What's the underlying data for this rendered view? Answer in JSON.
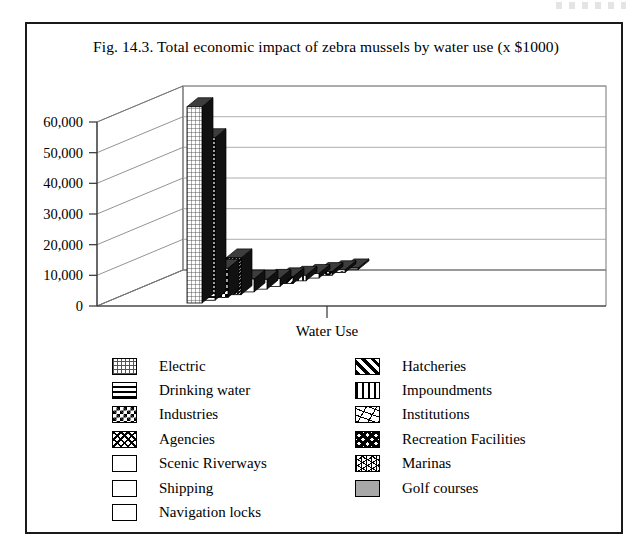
{
  "figure": {
    "caption": "Fig. 14.3.  Total economic impact of zebra mussels by water use (x $1000)"
  },
  "chart_data": {
    "type": "bar",
    "title": "Fig. 14.3.  Total economic impact of zebra mussels by water use (x $1000)",
    "xlabel": "Water Use",
    "ylabel": "",
    "ylim": [
      0,
      60000
    ],
    "yticks": [
      "0",
      "10,000",
      "20,000",
      "30,000",
      "40,000",
      "50,000",
      "60,000"
    ],
    "ytick_values": [
      0,
      10000,
      20000,
      30000,
      40000,
      50000,
      60000
    ],
    "grid": true,
    "projection": "3d-depth",
    "xtick_labels": [
      ""
    ],
    "legend_position": "below-plot-two-columns",
    "categories": [
      "Electric",
      "Drinking water",
      "Industries",
      "Agencies",
      "Scenic Riverways",
      "Shipping",
      "Navigation locks",
      "Hatcheries",
      "Impoundments",
      "Institutions",
      "Recreation Facilities",
      "Marinas",
      "Golf courses"
    ],
    "values": [
      64000,
      53000,
      9500,
      12000,
      4200,
      3200,
      2600,
      2200,
      1800,
      1500,
      1200,
      900,
      600
    ],
    "units": "x $1000"
  },
  "legend": {
    "left_column": [
      {
        "label": "Electric",
        "pattern": "grid-mesh-icon"
      },
      {
        "label": "Drinking water",
        "pattern": "horizontal-lines-icon"
      },
      {
        "label": "Industries",
        "pattern": "checkerboard-icon"
      },
      {
        "label": "Agencies",
        "pattern": "woven-crosshatch-icon"
      },
      {
        "label": "Scenic Riverways",
        "pattern": "blank-white-icon"
      },
      {
        "label": "Shipping",
        "pattern": "blank-white-icon"
      },
      {
        "label": "Navigation locks",
        "pattern": "blank-white-icon"
      }
    ],
    "right_column": [
      {
        "label": "Hatcheries",
        "pattern": "diagonal-stripes-icon"
      },
      {
        "label": "Impoundments",
        "pattern": "vertical-bars-icon"
      },
      {
        "label": "Institutions",
        "pattern": "squiggle-icon"
      },
      {
        "label": "Recreation Facilities",
        "pattern": "bold-zigzag-icon"
      },
      {
        "label": "Marinas",
        "pattern": "web-mesh-icon"
      },
      {
        "label": "Golf courses",
        "pattern": "solid-gray-icon"
      }
    ]
  },
  "colors": {
    "frame": "#1a1a1a",
    "axis": "#555555",
    "grid": "#888888",
    "bar_front": "#2a2a2a",
    "bar_side": "#111111",
    "bar_top": "#3d3d3d",
    "golf_gray": "#a8a8a8"
  }
}
